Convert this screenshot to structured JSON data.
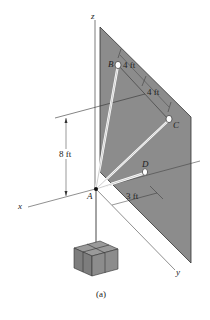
{
  "figure": {
    "caption": "(a)",
    "axes": {
      "x": "x",
      "y": "y",
      "z": "z"
    },
    "points": {
      "A": "A",
      "B": "B",
      "C": "C",
      "D": "D"
    },
    "dimensions": {
      "height": "8 ft",
      "b_to_mid": "4 ft",
      "mid_to_c": "4 ft",
      "a_to_plate": "3 ft"
    },
    "colors": {
      "plate": "#8c8c8c",
      "plate_edge": "#333333",
      "cable": "#ffffff",
      "box": "#8a8a8a",
      "line": "#333333"
    }
  }
}
